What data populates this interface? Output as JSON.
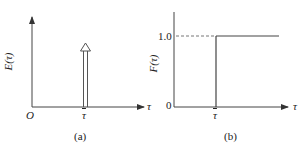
{
  "figure": {
    "panels": [
      {
        "id": "a",
        "caption": "(a)",
        "ylabel": "E(τ)",
        "xlabel": "τ",
        "origin_label": "O",
        "xtick_label": "τ",
        "description": "Dirac delta impulse at mean residence time τ̄"
      },
      {
        "id": "b",
        "caption": "(b)",
        "ylabel": "F(τ)",
        "xlabel": "τ",
        "ytick_labels": [
          "0",
          "1.0"
        ],
        "xtick_label": "τ",
        "description": "Unit step function at τ̄"
      }
    ]
  },
  "colors": {
    "line": "#555555",
    "axis": "#333333",
    "text": "#222222"
  }
}
